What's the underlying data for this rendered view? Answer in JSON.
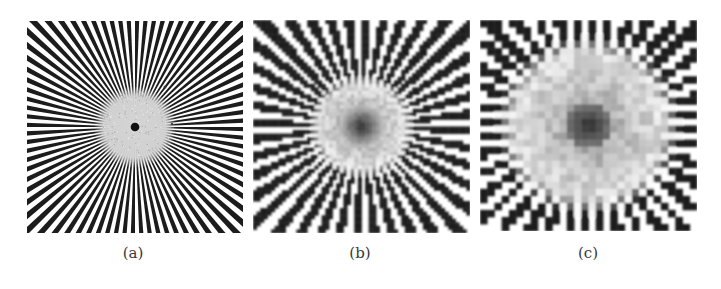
{
  "figure": {
    "panels": [
      {
        "id": "a",
        "caption": "(a)",
        "description": "Siemens star test pattern, original",
        "spokes": 80,
        "sampling_grid": 0,
        "center_disc_radius_frac": 0.19,
        "center_dot_radius_frac": 0.02
      },
      {
        "id": "b",
        "caption": "(b)",
        "description": "Siemens star sampled at moderate resolution showing moire/aliasing",
        "spokes": 80,
        "sampling_grid": 60,
        "center_disc_radius_frac": 0.24,
        "center_dot_radius_frac": 0.06
      },
      {
        "id": "c",
        "caption": "(c)",
        "description": "Siemens star sampled at coarse resolution showing strong aliasing checkerboard",
        "spokes": 80,
        "sampling_grid": 30,
        "center_disc_radius_frac": 0.42,
        "center_dot_radius_frac": 0.06
      }
    ],
    "colors": {
      "dark": "#1a1a1a",
      "light": "#ffffff",
      "center_gray": "#d4d4d4",
      "caption": "#3a3a3a"
    }
  }
}
